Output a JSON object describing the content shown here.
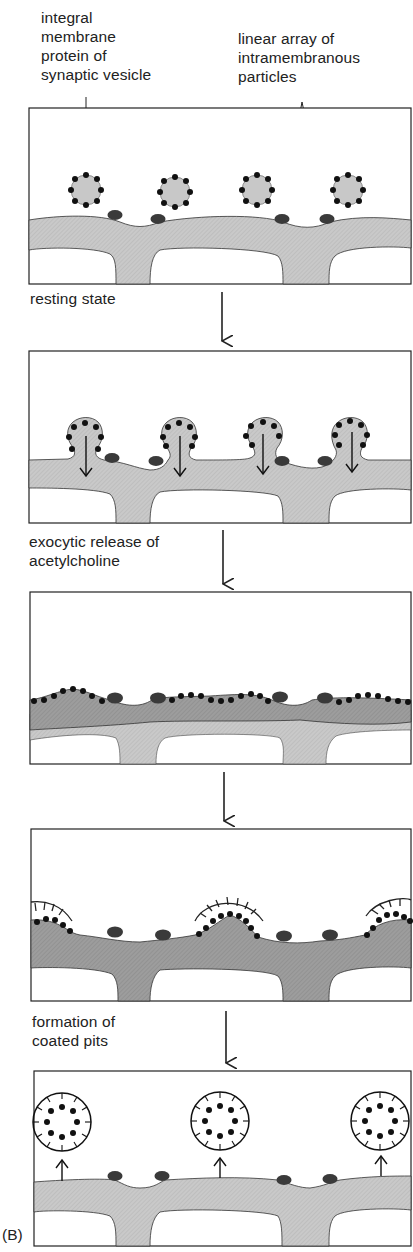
{
  "figure": {
    "panel_label": "(B)",
    "callouts": {
      "integral_protein": "integral\nmembrane\nprotein of\nsynaptic vesicle",
      "linear_array": "linear array of\nintramembranous\nparticles"
    },
    "steps": [
      {
        "label": "resting state"
      },
      {
        "label": "exocytic release of\nacetylcholine"
      },
      {
        "label": ""
      },
      {
        "label": "formation of\ncoated pits"
      }
    ],
    "panels": [
      {
        "name": "panel-resting",
        "description": "synaptic vesicles near presynaptic membrane with particles"
      },
      {
        "name": "panel-fusion",
        "description": "vesicles fusing with membrane, arrows downward"
      },
      {
        "name": "panel-release",
        "description": "vesicle membrane incorporated into plasma membrane"
      },
      {
        "name": "panel-coated-pits",
        "description": "coated pits forming around vesicle proteins"
      },
      {
        "name": "panel-recycling",
        "description": "coated vesicles budding off upward"
      }
    ],
    "colors": {
      "membrane_light": "#c8c8c8",
      "membrane_dark": "#9a9a9a",
      "particle": "#3a3a3a",
      "dot": "#111111",
      "line": "#222222"
    }
  }
}
